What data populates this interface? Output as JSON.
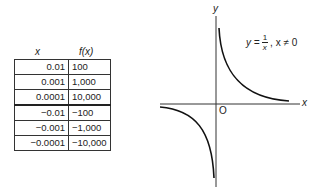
{
  "table": {
    "headers": {
      "x": "x",
      "fx": "f(x)"
    },
    "rows": [
      {
        "x": "0.01",
        "fx": "100"
      },
      {
        "x": "0.001",
        "fx": "1,000"
      },
      {
        "x": "0.0001",
        "fx": "10,000"
      },
      {
        "x": "−0.01",
        "fx": "−100"
      },
      {
        "x": "−0.001",
        "fx": "−1,000"
      },
      {
        "x": "−0.0001",
        "fx": "−10,000"
      }
    ]
  },
  "graph": {
    "x_label": "x",
    "y_label": "y",
    "origin_label": "O",
    "equation": {
      "lhs": "y =",
      "num": "1",
      "den": "x",
      "condition": ", x ≠ 0"
    }
  }
}
